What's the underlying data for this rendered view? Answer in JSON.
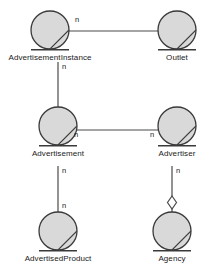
{
  "diagram": {
    "type": "object-model-diagram",
    "notation": "OMT",
    "width": 214,
    "height": 280,
    "background_color": "#ffffff",
    "style": {
      "node_fill": "#d9d9d9",
      "node_stroke": "#3a3a3a",
      "line_color": "#4a4a4a",
      "text_color": "#1a1a1a",
      "node_radius": 19,
      "node_stroke_width": 1.3,
      "line_width": 1.2
    },
    "nodes": [
      {
        "id": "advertisement-instance",
        "label": "AdvertisementInstance",
        "cx": 50,
        "cy": 30,
        "label_x": 50,
        "label_y": 56,
        "shape": "circle-with-chord"
      },
      {
        "id": "outlet",
        "label": "Outlet",
        "cx": 177,
        "cy": 30,
        "label_x": 177,
        "label_y": 56,
        "shape": "circle-with-chord"
      },
      {
        "id": "advertisement",
        "label": "Advertisement",
        "cx": 58,
        "cy": 126,
        "label_x": 58,
        "label_y": 152,
        "shape": "circle-with-chord"
      },
      {
        "id": "advertiser",
        "label": "Advertiser",
        "cx": 177,
        "cy": 126,
        "label_x": 177,
        "label_y": 152,
        "shape": "circle-with-chord"
      },
      {
        "id": "advertised-product",
        "label": "AdvertisedProduct",
        "cx": 58,
        "cy": 231,
        "label_x": 58,
        "label_y": 258,
        "shape": "circle-with-chord"
      },
      {
        "id": "agency",
        "label": "Agency",
        "cx": 172,
        "cy": 231,
        "label_x": 172,
        "label_y": 258,
        "shape": "circle-with-chord"
      }
    ],
    "edges": [
      {
        "id": "edge-advertisementinstance-outlet",
        "from": "advertisement-instance",
        "to": "outlet",
        "orientation": "horizontal",
        "x1": 68,
        "y1": 31,
        "x2": 159,
        "y2": 31,
        "adornment": "none"
      },
      {
        "id": "edge-advertisementinstance-advertisement",
        "from": "advertisement-instance",
        "to": "advertisement",
        "orientation": "vertical",
        "x1": 58,
        "y1": 64,
        "x2": 58,
        "y2": 108,
        "adornment": "none"
      },
      {
        "id": "edge-advertisement-advertiser",
        "from": "advertisement",
        "to": "advertiser",
        "orientation": "horizontal",
        "x1": 76,
        "y1": 130,
        "x2": 159,
        "y2": 130,
        "adornment": "none"
      },
      {
        "id": "edge-advertisement-advertisedproduct",
        "from": "advertisement",
        "to": "advertised-product",
        "orientation": "vertical",
        "x1": 58,
        "y1": 168,
        "x2": 58,
        "y2": 212,
        "adornment": "none"
      },
      {
        "id": "edge-advertiser-agency",
        "from": "advertiser",
        "to": "agency",
        "orientation": "vertical",
        "x1": 172,
        "y1": 168,
        "x2": 172,
        "y2": 212,
        "adornment": "hollow-diamond",
        "adornment_cx": 172,
        "adornment_cy": 202,
        "adornment_rx": 4,
        "adornment_ry": 6
      }
    ],
    "multiplicities": [
      {
        "id": "mult-ai-outlet",
        "text": "n",
        "x": 76,
        "y": 18
      },
      {
        "id": "mult-ai-advertisement",
        "text": "n",
        "x": 62,
        "y": 64
      },
      {
        "id": "mult-advertisement-advertiser-left",
        "text": "n",
        "x": 76,
        "y": 133
      },
      {
        "id": "mult-advertisement-advertiser-right",
        "text": "n",
        "x": 151,
        "y": 133
      },
      {
        "id": "mult-advertisement-product-top",
        "text": "n",
        "x": 62,
        "y": 168
      },
      {
        "id": "mult-advertisement-product-bottom",
        "text": "n",
        "x": 62,
        "y": 203
      },
      {
        "id": "mult-advertiser-agency",
        "text": "n",
        "x": 176,
        "y": 168
      }
    ]
  }
}
